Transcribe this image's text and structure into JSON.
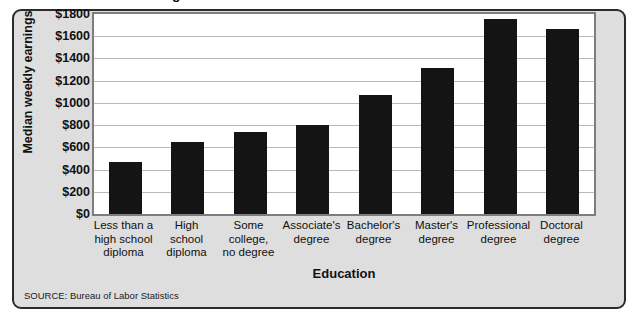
{
  "figure": {
    "title_partial": "Education and Earnings",
    "source_note": "SOURCE: Bureau of Labor Statistics",
    "colors": {
      "bar": "#141414",
      "panel_background": "#dedede",
      "plot_background": "#ffffff",
      "gridline": "#b9b9b9",
      "panel_border": "#2b2b2b",
      "plot_border": "#7d7d7d",
      "text": "#111111"
    }
  },
  "chart_data": {
    "type": "bar",
    "title": "Education and Earnings",
    "xlabel": "Education",
    "ylabel": "Median weekly earnings",
    "categories": [
      "Less than a high school diploma",
      "High school diploma",
      "Some college, no degree",
      "Associate's degree",
      "Bachelor's degree",
      "Master's degree",
      "Professional degree",
      "Doctoral degree"
    ],
    "category_lines": [
      [
        "Less than a",
        "high school",
        "diploma"
      ],
      [
        "High",
        "school",
        "diploma"
      ],
      [
        "Some",
        "college,",
        "no degree"
      ],
      [
        "Associate's",
        "degree"
      ],
      [
        "Bachelor's",
        "degree"
      ],
      [
        "Master's",
        "degree"
      ],
      [
        "Professional",
        "degree"
      ],
      [
        "Doctoral",
        "degree"
      ]
    ],
    "values": [
      470,
      645,
      740,
      800,
      1075,
      1310,
      1755,
      1665
    ],
    "ylim": [
      0,
      1800
    ],
    "ytick_values": [
      0,
      200,
      400,
      600,
      800,
      1000,
      1200,
      1400,
      1600,
      1800
    ],
    "ytick_labels": [
      "$0",
      "$200",
      "$400",
      "$600",
      "$800",
      "$1000",
      "$1200",
      "$1400",
      "$1600",
      "$1800"
    ],
    "grid": true,
    "legend": null,
    "legend_position": "none",
    "source": "Bureau of Labor Statistics"
  }
}
